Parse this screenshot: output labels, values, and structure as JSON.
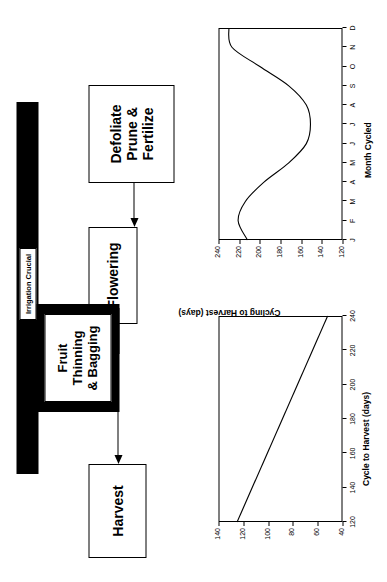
{
  "figure": {
    "orientation": "rotated-90",
    "background": "#ffffff",
    "ink": "#000000"
  },
  "flowchart": {
    "nodes": [
      {
        "id": "defoliate",
        "line1": "Defoliate",
        "line2": "Prune & Fertilize",
        "style": "plain"
      },
      {
        "id": "flowering",
        "line1": "Flowering",
        "line2": "",
        "style": "plain"
      },
      {
        "id": "fruit-set",
        "line1": "Fruit Set",
        "line2": "",
        "style": "highlight"
      },
      {
        "id": "fruit-thinning",
        "line1": "Fruit Thinning",
        "line2": "& Bagging",
        "style": "highlight"
      },
      {
        "id": "harvest",
        "line1": "Harvest",
        "line2": "",
        "style": "plain"
      }
    ],
    "irrigation_bar": {
      "label": "Irrigation Crucial",
      "color": "#000000"
    },
    "arrows": [
      {
        "from": "defoliate",
        "to": "flowering"
      },
      {
        "from": "flowering",
        "to": "harvest"
      }
    ]
  },
  "chart_data": [
    {
      "id": "cycling-to-harvest",
      "type": "line",
      "title": "",
      "xlabel": "Month Cycled",
      "ylabel": "Cycling to Harvest (days)",
      "categories": [
        "J",
        "F",
        "M",
        "A",
        "M",
        "J",
        "J",
        "A",
        "S",
        "O",
        "N",
        "D"
      ],
      "x": [
        1,
        2,
        3,
        4,
        5,
        6,
        7,
        8,
        9,
        10,
        11,
        12
      ],
      "values": [
        212,
        221,
        214,
        196,
        172,
        155,
        151,
        155,
        172,
        200,
        227,
        230
      ],
      "xlim": [
        1,
        12
      ],
      "ylim": [
        120,
        240
      ],
      "yticks": [
        120,
        140,
        160,
        180,
        200,
        220,
        240
      ],
      "grid": false,
      "legend": "none"
    },
    {
      "id": "harvest-duration",
      "type": "line",
      "title": "",
      "xlabel": "Cycle to Harvest (days)",
      "ylabel": "Harvest Duration (days)",
      "x": [
        120,
        240
      ],
      "values": [
        125,
        52
      ],
      "xlim": [
        120,
        240
      ],
      "ylim": [
        40,
        140
      ],
      "xticks": [
        120,
        140,
        160,
        180,
        200,
        220,
        240
      ],
      "yticks": [
        40,
        60,
        80,
        100,
        120,
        140
      ],
      "grid": false,
      "legend": "none"
    }
  ]
}
